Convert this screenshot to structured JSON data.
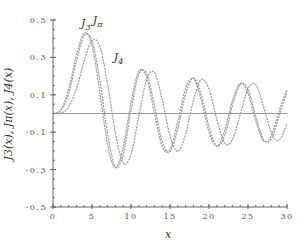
{
  "chart_data": {
    "type": "line",
    "title": "",
    "xlabel": "x",
    "ylabel": "J3(x), Jπ(x), J4(x)",
    "xlim": [
      0,
      30
    ],
    "ylim": [
      -0.5,
      0.5
    ],
    "xticks": [
      0,
      5,
      10,
      15,
      20,
      25,
      30
    ],
    "yticks": [
      -0.5,
      -0.3,
      -0.1,
      0.1,
      0.3,
      0.5
    ],
    "ytick_labels": [
      "-0.5",
      "-0.3",
      "-0.1",
      "0.1",
      "0.3",
      "0.5"
    ],
    "grid": false,
    "zero_line": true,
    "x": [
      0,
      1,
      2,
      3,
      4,
      5,
      6,
      7,
      8,
      9,
      10,
      11,
      12,
      13,
      14,
      15,
      16,
      17,
      18,
      19,
      20,
      21,
      22,
      23,
      24,
      25,
      26,
      27,
      28,
      29,
      30
    ],
    "series": [
      {
        "name": "J3",
        "label": "J3",
        "values": [
          0,
          0.0196,
          0.1289,
          0.3091,
          0.4302,
          0.3648,
          0.1148,
          -0.1676,
          -0.2911,
          -0.1809,
          0.0584,
          0.2273,
          0.1951,
          0.0033,
          -0.1768,
          -0.194,
          -0.0438,
          0.1349,
          0.1863,
          0.0724,
          -0.0989,
          -0.175,
          -0.0925,
          0.0677,
          0.1613,
          0.108,
          -0.0404,
          -0.1459,
          -0.1165,
          0.0154,
          0.129
        ]
      },
      {
        "name": "Jpi",
        "label": "Jπ",
        "values": [
          0,
          0.015,
          0.105,
          0.28,
          0.415,
          0.39,
          0.18,
          -0.11,
          -0.285,
          -0.22,
          0.015,
          0.21,
          0.215,
          0.045,
          -0.15,
          -0.205,
          -0.08,
          0.105,
          0.19,
          0.1,
          -0.07,
          -0.175,
          -0.12,
          0.04,
          0.155,
          0.13,
          -0.015,
          -0.14,
          -0.135,
          -0.01,
          0.12
        ]
      },
      {
        "name": "J4",
        "label": "J4",
        "values": [
          0,
          0.0025,
          0.034,
          0.132,
          0.2811,
          0.3912,
          0.3576,
          0.1578,
          -0.1054,
          -0.2655,
          -0.2196,
          -0.015,
          0.1825,
          0.2193,
          0.0762,
          -0.1192,
          -0.2026,
          -0.1107,
          0.0696,
          0.1806,
          0.1307,
          -0.0297,
          -0.1578,
          -0.141,
          -0.0056,
          0.1318,
          0.1539,
          0.034,
          -0.1017,
          -0.1428,
          -0.0525
        ]
      }
    ],
    "annotations": [
      {
        "text": "J3",
        "x": 3.6,
        "y": 0.46
      },
      {
        "text": "Jπ",
        "x": 5.1,
        "y": 0.48
      },
      {
        "text": "J4",
        "x": 7.8,
        "y": 0.28
      }
    ],
    "line_color": "#999999",
    "axis_color": "#666666"
  }
}
